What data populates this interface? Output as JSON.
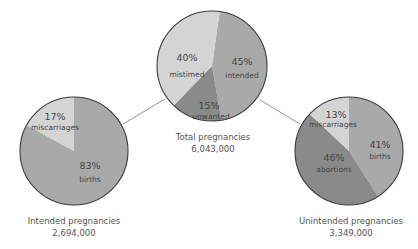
{
  "chart_data": [
    {
      "type": "pie",
      "title": "Total pregnancies",
      "total": "6,043,000",
      "slices": [
        {
          "label": "intended",
          "value": 45,
          "color": "#a9a9a9"
        },
        {
          "label": "unwanted",
          "value": 15,
          "color": "#8a8a8a"
        },
        {
          "label": "mistimed",
          "value": 40,
          "color": "#d4d4d4"
        }
      ]
    },
    {
      "type": "pie",
      "title": "Intended pregnancies",
      "total": "2,694,000",
      "slices": [
        {
          "label": "births",
          "value": 83,
          "color": "#a9a9a9"
        },
        {
          "label": "miscarriages",
          "value": 17,
          "color": "#d4d4d4"
        }
      ]
    },
    {
      "type": "pie",
      "title": "Unintended pregnancies",
      "total": "3,349,000",
      "slices": [
        {
          "label": "births",
          "value": 41,
          "color": "#a9a9a9"
        },
        {
          "label": "abortions",
          "value": 46,
          "color": "#8a8a8a"
        },
        {
          "label": "miscarriages",
          "value": 13,
          "color": "#d4d4d4"
        }
      ]
    }
  ],
  "pies": {
    "total": {
      "title": "Total pregnancies",
      "count": "6,043,000",
      "intended": {
        "pct": "45%",
        "label": "intended"
      },
      "unwanted": {
        "pct": "15%",
        "label": "unwanted"
      },
      "mistimed": {
        "pct": "40%",
        "label": "mistimed"
      }
    },
    "intended": {
      "title": "Intended pregnancies",
      "count": "2,694,000",
      "births": {
        "pct": "83%",
        "label": "births"
      },
      "miscarriages": {
        "pct": "17%",
        "label": "miscarriages"
      }
    },
    "unintended": {
      "title": "Unintended pregnancies",
      "count": "3,349,000",
      "births": {
        "pct": "41%",
        "label": "births"
      },
      "abortions": {
        "pct": "46%",
        "label": "abortions"
      },
      "miscarriages": {
        "pct": "13%",
        "label": "miscarriages"
      }
    }
  },
  "colors": {
    "light": "#d4d4d4",
    "medium": "#a9a9a9",
    "dark": "#8a8a8a",
    "outline": "#3a3a3a",
    "connector": "#777777"
  }
}
